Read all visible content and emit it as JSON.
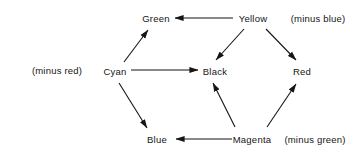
{
  "figure": {
    "type": "diagram",
    "background_color": "#ffffff",
    "ink_color": "#151515"
  },
  "nodes": [
    {
      "id": "green",
      "label": "Green",
      "x": 156,
      "y": 18
    },
    {
      "id": "yellow",
      "label": "Yellow",
      "x": 253,
      "y": 18
    },
    {
      "id": "cyan",
      "label": "Cyan",
      "x": 115,
      "y": 71
    },
    {
      "id": "black",
      "label": "Black",
      "x": 215,
      "y": 71
    },
    {
      "id": "red",
      "label": "Red",
      "x": 302,
      "y": 71
    },
    {
      "id": "blue",
      "label": "Blue",
      "x": 157,
      "y": 139
    },
    {
      "id": "magenta",
      "label": "Magenta",
      "x": 252,
      "y": 139
    }
  ],
  "annotations": [
    {
      "id": "minus-blue",
      "label": "(minus blue)",
      "x": 318,
      "y": 18
    },
    {
      "id": "minus-red",
      "label": "(minus red)",
      "x": 57,
      "y": 70
    },
    {
      "id": "minus-green",
      "label": "(minus green)",
      "x": 315,
      "y": 139
    }
  ],
  "edges": [
    {
      "id": "yellow-to-green",
      "from": "yellow",
      "to": "green",
      "x1": 233,
      "y1": 18,
      "x2": 175,
      "y2": 18
    },
    {
      "id": "cyan-to-green",
      "from": "cyan",
      "to": "green",
      "x1": 124,
      "y1": 62,
      "x2": 148,
      "y2": 30
    },
    {
      "id": "yellow-to-black",
      "from": "yellow",
      "to": "black",
      "x1": 244,
      "y1": 29,
      "x2": 216,
      "y2": 60
    },
    {
      "id": "yellow-to-red",
      "from": "yellow",
      "to": "red",
      "x1": 266,
      "y1": 29,
      "x2": 296,
      "y2": 60
    },
    {
      "id": "cyan-to-black",
      "from": "cyan",
      "to": "black",
      "x1": 131,
      "y1": 70,
      "x2": 198,
      "y2": 70
    },
    {
      "id": "cyan-to-blue",
      "from": "cyan",
      "to": "blue",
      "x1": 119,
      "y1": 83,
      "x2": 147,
      "y2": 128
    },
    {
      "id": "magenta-to-black",
      "from": "magenta",
      "to": "black",
      "x1": 235,
      "y1": 127,
      "x2": 213,
      "y2": 83
    },
    {
      "id": "magenta-to-red",
      "from": "magenta",
      "to": "red",
      "x1": 267,
      "y1": 127,
      "x2": 296,
      "y2": 84
    },
    {
      "id": "magenta-to-blue",
      "from": "magenta",
      "to": "blue",
      "x1": 232,
      "y1": 139,
      "x2": 176,
      "y2": 139
    }
  ]
}
